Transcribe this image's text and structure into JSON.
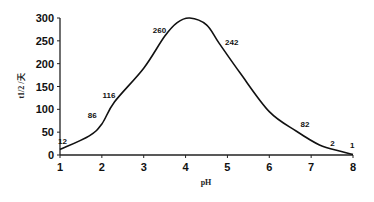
{
  "chart_data": {
    "type": "line",
    "title": "",
    "xlabel": "pH",
    "ylabel": "t1/2 /天",
    "xlim": [
      1,
      8
    ],
    "ylim": [
      0,
      300
    ],
    "x_ticks": [
      1,
      2,
      3,
      4,
      5,
      6,
      7,
      8
    ],
    "y_ticks": [
      0,
      50,
      100,
      150,
      200,
      250,
      300
    ],
    "grid": false,
    "legend": null,
    "series": [
      {
        "name": "half-life",
        "color": "#111111",
        "smooth": true,
        "x": [
          1.0,
          1.7,
          2.0,
          2.3,
          3.0,
          3.5,
          3.8,
          4.1,
          4.5,
          4.8,
          5.3,
          6.0,
          6.65,
          7.2,
          7.7,
          8.0
        ],
        "y": [
          12,
          42,
          68,
          116,
          190,
          260,
          290,
          300,
          285,
          245,
          180,
          95,
          52,
          22,
          8,
          1
        ]
      }
    ],
    "annotations": [
      {
        "text": "12",
        "x": 1.0,
        "y": 12
      },
      {
        "text": "86",
        "x": 2.0,
        "y": 68
      },
      {
        "text": "116",
        "x": 2.4,
        "y": 116
      },
      {
        "text": "260",
        "x": 3.6,
        "y": 260
      },
      {
        "text": "242",
        "x": 4.8,
        "y": 245
      },
      {
        "text": "82",
        "x": 6.65,
        "y": 52
      },
      {
        "text": "2",
        "x": 7.6,
        "y": 10
      },
      {
        "text": "1",
        "x": 8.0,
        "y": 1
      }
    ]
  }
}
